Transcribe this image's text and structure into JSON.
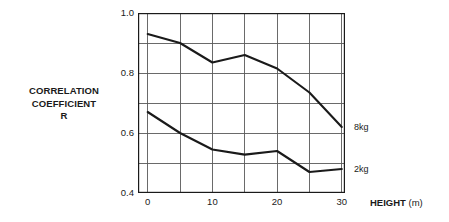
{
  "chart_data": {
    "type": "line",
    "title": "",
    "xlabel_bold": "HEIGHT",
    "xlabel_unit": "(m)",
    "ylabel_lines": [
      "CORRELATION",
      "COEFFICIENT",
      "R"
    ],
    "xlim": [
      -1.5,
      30.5
    ],
    "ylim": [
      0.4,
      1.0
    ],
    "xticks": [
      0,
      10,
      20,
      30
    ],
    "xtick_labels": [
      "0",
      "10",
      "20",
      "30"
    ],
    "x_minor_gridlines": [
      5,
      15,
      25
    ],
    "yticks": [
      0.4,
      0.6,
      0.8,
      1.0
    ],
    "ytick_labels": [
      "0.4",
      "0.6",
      "0.8",
      "1.0"
    ],
    "y_minor_gridlines": [
      0.5,
      0.7,
      0.9
    ],
    "grid": true,
    "legend_position": "right-of-axes-at-line-end",
    "x": [
      0,
      5,
      10,
      15,
      20,
      25,
      30
    ],
    "series": [
      {
        "name": "8kg",
        "label": "8kg",
        "color": "#1a1a1a",
        "values": [
          0.93,
          0.9,
          0.835,
          0.86,
          0.815,
          0.735,
          0.62
        ]
      },
      {
        "name": "2kg",
        "label": "2kg",
        "color": "#1a1a1a",
        "values": [
          0.67,
          0.6,
          0.545,
          0.528,
          0.54,
          0.47,
          0.48
        ]
      }
    ],
    "annotations": []
  },
  "colors": {
    "axis": "#1a1a1a",
    "grid": "#5a5a5a",
    "line": "#1a1a1a",
    "background": "#ffffff",
    "text": "#1a1a1a"
  }
}
